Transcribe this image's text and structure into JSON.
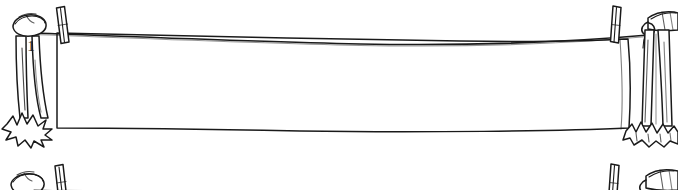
{
  "scene": {
    "title": "Blank banner on a clothesline between two poles",
    "style": "hand-drawn black-and-white line art",
    "width": 678,
    "height": 190,
    "background_color": "#ffffff",
    "ink_color": "#1a1a1a"
  },
  "left_post": {
    "name": "left post",
    "label": "1",
    "has_cap": true,
    "has_grass_tuft": true
  },
  "right_post": {
    "name": "right post",
    "label": "",
    "has_cap": true,
    "has_grass_tuft": true,
    "has_tied_cloth": true
  },
  "rope": {
    "name": "clothesline rope",
    "sag": "slight downward sag toward the middle"
  },
  "banner": {
    "name": "blank hanging banner",
    "content_text": "",
    "fill_color": "#ffffff",
    "edge_color": "#1a1a1a"
  },
  "clothespins": [
    {
      "name": "left clothespin",
      "position": "left"
    },
    {
      "name": "right clothespin",
      "position": "right"
    }
  ],
  "repeat_strip": {
    "name": "partial repeat of scene below",
    "visible": true
  }
}
